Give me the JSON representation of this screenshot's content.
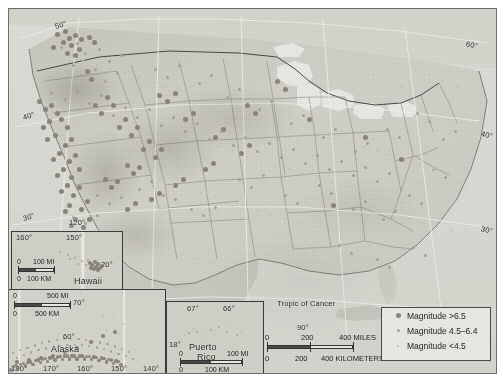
{
  "map": {
    "title": "United States Seismicity Map",
    "graticule_labels_main": [
      {
        "text": "50°",
        "x": 46,
        "y": 13,
        "rot": "l"
      },
      {
        "text": "60°",
        "x": 457,
        "y": 30,
        "rot": "r"
      },
      {
        "text": "40°",
        "x": 14,
        "y": 104,
        "rot": "l"
      },
      {
        "text": "40°",
        "x": 472,
        "y": 120,
        "rot": "r"
      },
      {
        "text": "30°",
        "x": 14,
        "y": 205,
        "rot": "l"
      },
      {
        "text": "30°",
        "x": 472,
        "y": 215,
        "rot": "r"
      },
      {
        "text": "120°",
        "x": 60,
        "y": 209,
        "rot": "none"
      },
      {
        "text": "90°",
        "x": 288,
        "y": 314,
        "rot": "none"
      },
      {
        "text": "80°",
        "x": 430,
        "y": 370,
        "rot": "none"
      }
    ],
    "tropic_label": "Tropic of Cancer"
  },
  "legend": {
    "items": [
      {
        "label": "Magnitude >6.5",
        "class": "hi",
        "size": 5,
        "color": "#8a8379"
      },
      {
        "label": "Magnitude 4.5–6.4",
        "class": "md",
        "size": 3,
        "color": "#a3a099"
      },
      {
        "label": "Magnitude <4.5",
        "class": "lo",
        "size": 2,
        "color": "#c0beb6"
      }
    ]
  },
  "main_scale": {
    "miles": {
      "zero": "0",
      "mid": "200",
      "end": "400 MILES"
    },
    "km": {
      "zero": "0",
      "mid": "200",
      "end": "400 KILOMETERS"
    }
  },
  "insets": {
    "hawaii": {
      "name": "Hawaii",
      "lon_labels": [
        "160°",
        "150°"
      ],
      "lat_labels": [
        "20°"
      ],
      "scale": {
        "miles": {
          "zero": "0",
          "end": "100 MI"
        },
        "km": {
          "zero": "0",
          "end": "100 KM"
        }
      }
    },
    "alaska": {
      "name": "Alaska",
      "lon_labels": [
        "180°",
        "170°",
        "160°",
        "150°",
        "140°"
      ],
      "lat_labels": [
        "70°",
        "60°"
      ],
      "scale": {
        "miles": {
          "zero": "0",
          "end": "500 MI"
        },
        "km": {
          "zero": "0",
          "end": "500 KM"
        }
      }
    },
    "puerto_rico": {
      "name_line1": "Puerto",
      "name_line2": "Rico",
      "lon_labels": [
        "67°",
        "66°"
      ],
      "lat_labels": [
        "18°"
      ],
      "scale": {
        "miles": {
          "zero": "0",
          "end": "100 MI"
        },
        "km": {
          "zero": "0",
          "end": "100 KM"
        }
      }
    }
  },
  "chart_data": {
    "type": "scatter",
    "legend_position": "bottom-right",
    "categories": [
      "Magnitude >6.5",
      "Magnitude 4.5–6.4",
      "Magnitude <4.5"
    ],
    "series": [
      {
        "name": "Magnitude >6.5",
        "marker_color": "#8a8379",
        "marker_size": 5,
        "points": [
          [
            48,
            25
          ],
          [
            56,
            22
          ],
          [
            60,
            29
          ],
          [
            66,
            26
          ],
          [
            72,
            30
          ],
          [
            54,
            33
          ],
          [
            62,
            36
          ],
          [
            80,
            28
          ],
          [
            44,
            38
          ],
          [
            70,
            40
          ],
          [
            85,
            33
          ],
          [
            58,
            44
          ],
          [
            66,
            46
          ],
          [
            78,
            62
          ],
          [
            82,
            70
          ],
          [
            30,
            92
          ],
          [
            36,
            100
          ],
          [
            42,
            96
          ],
          [
            48,
            104
          ],
          [
            40,
            112
          ],
          [
            34,
            118
          ],
          [
            52,
            110
          ],
          [
            58,
            118
          ],
          [
            46,
            126
          ],
          [
            38,
            130
          ],
          [
            56,
            136
          ],
          [
            62,
            130
          ],
          [
            50,
            144
          ],
          [
            44,
            150
          ],
          [
            60,
            152
          ],
          [
            66,
            146
          ],
          [
            54,
            160
          ],
          [
            48,
            166
          ],
          [
            62,
            168
          ],
          [
            70,
            160
          ],
          [
            58,
            176
          ],
          [
            52,
            182
          ],
          [
            64,
            186
          ],
          [
            70,
            178
          ],
          [
            60,
            196
          ],
          [
            56,
            202
          ],
          [
            72,
            200
          ],
          [
            78,
            192
          ],
          [
            66,
            210
          ],
          [
            62,
            216
          ],
          [
            74,
            218
          ],
          [
            80,
            210
          ],
          [
            70,
            226
          ],
          [
            66,
            232
          ],
          [
            86,
            96
          ],
          [
            92,
            104
          ],
          [
            98,
            88
          ],
          [
            104,
            96
          ],
          [
            110,
            118
          ],
          [
            116,
            110
          ],
          [
            122,
            126
          ],
          [
            128,
            118
          ],
          [
            134,
            140
          ],
          [
            140,
            132
          ],
          [
            146,
            148
          ],
          [
            152,
            140
          ],
          [
            118,
            156
          ],
          [
            124,
            164
          ],
          [
            130,
            158
          ],
          [
            96,
            170
          ],
          [
            102,
            178
          ],
          [
            108,
            172
          ],
          [
            150,
            86
          ],
          [
            158,
            92
          ],
          [
            166,
            84
          ],
          [
            176,
            110
          ],
          [
            184,
            104
          ],
          [
            206,
            128
          ],
          [
            214,
            120
          ],
          [
            232,
            144
          ],
          [
            240,
            136
          ],
          [
            196,
            160
          ],
          [
            204,
            154
          ],
          [
            166,
            176
          ],
          [
            174,
            170
          ],
          [
            142,
            190
          ],
          [
            150,
            184
          ],
          [
            118,
            200
          ],
          [
            126,
            194
          ],
          [
            238,
            96
          ],
          [
            246,
            104
          ],
          [
            268,
            72
          ],
          [
            276,
            80
          ],
          [
            300,
            110
          ],
          [
            356,
            128
          ],
          [
            392,
            150
          ],
          [
            324,
            196
          ]
        ]
      },
      {
        "name": "Magnitude 4.5–6.4",
        "marker_color": "#a3a099",
        "marker_size": 3,
        "points": [
          [
            52,
            38
          ],
          [
            68,
            34
          ],
          [
            76,
            44
          ],
          [
            90,
            40
          ],
          [
            100,
            52
          ],
          [
            112,
            46
          ],
          [
            64,
            56
          ],
          [
            72,
            66
          ],
          [
            86,
            60
          ],
          [
            96,
            72
          ],
          [
            108,
            64
          ],
          [
            42,
            84
          ],
          [
            56,
            90
          ],
          [
            68,
            82
          ],
          [
            80,
            94
          ],
          [
            92,
            86
          ],
          [
            104,
            106
          ],
          [
            116,
            98
          ],
          [
            128,
            108
          ],
          [
            140,
            100
          ],
          [
            152,
            116
          ],
          [
            164,
            108
          ],
          [
            176,
            122
          ],
          [
            188,
            114
          ],
          [
            200,
            130
          ],
          [
            212,
            122
          ],
          [
            224,
            136
          ],
          [
            236,
            128
          ],
          [
            248,
            142
          ],
          [
            260,
            134
          ],
          [
            272,
            148
          ],
          [
            284,
            140
          ],
          [
            296,
            154
          ],
          [
            308,
            146
          ],
          [
            320,
            160
          ],
          [
            332,
            152
          ],
          [
            344,
            166
          ],
          [
            356,
            158
          ],
          [
            368,
            172
          ],
          [
            380,
            164
          ],
          [
            130,
            180
          ],
          [
            142,
            172
          ],
          [
            154,
            186
          ],
          [
            166,
            190
          ],
          [
            88,
            186
          ],
          [
            100,
            194
          ],
          [
            112,
            188
          ],
          [
            64,
            208
          ],
          [
            76,
            214
          ],
          [
            88,
            206
          ],
          [
            182,
            200
          ],
          [
            194,
            206
          ],
          [
            206,
            198
          ],
          [
            230,
            170
          ],
          [
            242,
            178
          ],
          [
            254,
            166
          ],
          [
            276,
            186
          ],
          [
            288,
            194
          ],
          [
            310,
            176
          ],
          [
            322,
            184
          ],
          [
            344,
            200
          ],
          [
            356,
            192
          ],
          [
            374,
            210
          ],
          [
            386,
            202
          ],
          [
            400,
            186
          ],
          [
            412,
            194
          ],
          [
            424,
            160
          ],
          [
            436,
            168
          ],
          [
            146,
            60
          ],
          [
            158,
            68
          ],
          [
            170,
            56
          ],
          [
            190,
            74
          ],
          [
            202,
            66
          ],
          [
            218,
            88
          ],
          [
            230,
            80
          ],
          [
            250,
            100
          ],
          [
            262,
            92
          ],
          [
            282,
            114
          ],
          [
            294,
            106
          ],
          [
            314,
            128
          ],
          [
            326,
            120
          ],
          [
            346,
            142
          ],
          [
            358,
            134
          ],
          [
            378,
            120
          ],
          [
            390,
            128
          ],
          [
            408,
            104
          ],
          [
            420,
            112
          ],
          [
            434,
            130
          ],
          [
            446,
            122
          ],
          [
            404,
            238
          ],
          [
            416,
            246
          ],
          [
            368,
            250
          ],
          [
            380,
            258
          ],
          [
            330,
            236
          ],
          [
            342,
            244
          ]
        ]
      },
      {
        "name": "Magnitude <4.5",
        "marker_color": "#c0beb6",
        "marker_size": 2,
        "points": [
          [
            60,
            48
          ],
          [
            74,
            52
          ],
          [
            88,
            56
          ],
          [
            102,
            60
          ],
          [
            116,
            64
          ],
          [
            130,
            68
          ],
          [
            144,
            74
          ],
          [
            158,
            78
          ],
          [
            172,
            82
          ],
          [
            186,
            86
          ],
          [
            200,
            90
          ],
          [
            214,
            94
          ],
          [
            228,
            100
          ],
          [
            242,
            104
          ],
          [
            256,
            108
          ],
          [
            270,
            112
          ],
          [
            284,
            116
          ],
          [
            298,
            120
          ],
          [
            312,
            126
          ],
          [
            326,
            130
          ],
          [
            340,
            134
          ],
          [
            354,
            138
          ],
          [
            368,
            142
          ],
          [
            382,
            146
          ],
          [
            396,
            152
          ],
          [
            410,
            156
          ],
          [
            424,
            160
          ],
          [
            438,
            164
          ],
          [
            70,
            96
          ],
          [
            84,
            100
          ],
          [
            98,
            104
          ],
          [
            112,
            108
          ],
          [
            126,
            112
          ],
          [
            140,
            116
          ],
          [
            154,
            122
          ],
          [
            168,
            126
          ],
          [
            182,
            130
          ],
          [
            196,
            134
          ],
          [
            210,
            138
          ],
          [
            224,
            142
          ],
          [
            238,
            148
          ],
          [
            252,
            152
          ],
          [
            266,
            156
          ],
          [
            280,
            160
          ],
          [
            294,
            164
          ],
          [
            308,
            168
          ],
          [
            322,
            174
          ],
          [
            336,
            178
          ],
          [
            350,
            182
          ],
          [
            364,
            186
          ],
          [
            378,
            190
          ],
          [
            392,
            194
          ],
          [
            80,
            150
          ],
          [
            94,
            154
          ],
          [
            108,
            158
          ],
          [
            122,
            162
          ],
          [
            136,
            166
          ],
          [
            150,
            170
          ],
          [
            164,
            176
          ],
          [
            178,
            180
          ],
          [
            192,
            184
          ],
          [
            206,
            188
          ],
          [
            220,
            192
          ],
          [
            234,
            196
          ],
          [
            248,
            202
          ],
          [
            262,
            206
          ],
          [
            276,
            210
          ],
          [
            290,
            214
          ],
          [
            304,
            218
          ],
          [
            318,
            222
          ],
          [
            90,
            220
          ],
          [
            104,
            224
          ],
          [
            118,
            228
          ],
          [
            132,
            232
          ],
          [
            146,
            236
          ],
          [
            160,
            240
          ],
          [
            174,
            246
          ],
          [
            188,
            250
          ],
          [
            202,
            254
          ],
          [
            216,
            258
          ],
          [
            332,
            228
          ],
          [
            346,
            232
          ],
          [
            360,
            236
          ],
          [
            374,
            240
          ],
          [
            400,
            210
          ],
          [
            414,
            214
          ],
          [
            428,
            218
          ],
          [
            442,
            222
          ],
          [
            406,
            60
          ],
          [
            420,
            66
          ],
          [
            434,
            72
          ],
          [
            448,
            78
          ],
          [
            350,
            60
          ],
          [
            364,
            66
          ],
          [
            378,
            72
          ],
          [
            392,
            78
          ]
        ]
      }
    ]
  }
}
